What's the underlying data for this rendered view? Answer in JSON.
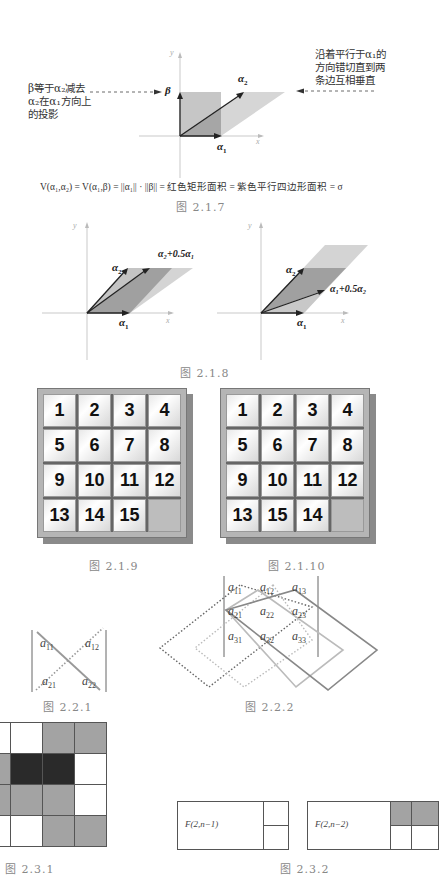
{
  "figure_2_1_7": {
    "caption": "图  2.1.7",
    "left_note": "β等于α₂减去\nα₂在α₁方向上\n的投影",
    "right_note": "沿着平行于α₁的\n方向错切直到两\n条边互相垂直",
    "labels": {
      "beta": "β",
      "alpha1": "α",
      "alpha1_sub": "1",
      "alpha2": "α",
      "alpha2_sub": "2",
      "x_axis": "x",
      "y_axis": "y"
    },
    "formula": "V(α₁,α₂) = V(α₁,β) = ||α₁|| · ||β|| = 红色矩形面积 = 紫色平行四边形面积  = σ",
    "colors": {
      "rectangle": "#c8c8c8",
      "parallelogram": "#d6d6d6",
      "overlap": "#a6a6a6"
    }
  },
  "figure_2_1_8": {
    "caption": "图  2.1.8",
    "left": {
      "alpha1": "α",
      "alpha1_sub": "1",
      "alpha2": "α",
      "alpha2_sub": "2",
      "sum_label": "α₂+0.5α₁",
      "x_axis": "x",
      "y_axis": "y"
    },
    "right": {
      "alpha1": "α",
      "alpha1_sub": "1",
      "alpha2": "α",
      "alpha2_sub": "2",
      "sum_label": "α₁+0.5α₂",
      "x_axis": "x",
      "y_axis": "y"
    }
  },
  "figure_2_1_9": {
    "caption": "图  2.1.9",
    "tiles": [
      "1",
      "2",
      "3",
      "4",
      "5",
      "6",
      "7",
      "8",
      "9",
      "10",
      "11",
      "12",
      "13",
      "14",
      "15",
      ""
    ]
  },
  "figure_2_1_10": {
    "caption": "图  2.1.10",
    "tiles": [
      "1",
      "2",
      "3",
      "4",
      "5",
      "6",
      "7",
      "8",
      "9",
      "10",
      "11",
      "12",
      "13",
      "15",
      "14",
      ""
    ]
  },
  "figure_2_2_1": {
    "caption": "图  2.2.1",
    "entries": [
      {
        "base": "a",
        "sub": "11"
      },
      {
        "base": "a",
        "sub": "12"
      },
      {
        "base": "a",
        "sub": "21"
      },
      {
        "base": "a",
        "sub": "22"
      }
    ]
  },
  "figure_2_2_2": {
    "caption": "图  2.2.2",
    "entries": [
      {
        "base": "a",
        "sub": "11"
      },
      {
        "base": "a",
        "sub": "12"
      },
      {
        "base": "a",
        "sub": "13"
      },
      {
        "base": "a",
        "sub": "21"
      },
      {
        "base": "a",
        "sub": "22"
      },
      {
        "base": "a",
        "sub": "23"
      },
      {
        "base": "a",
        "sub": "31"
      },
      {
        "base": "a",
        "sub": "32"
      },
      {
        "base": "a",
        "sub": "33"
      }
    ]
  },
  "figure_2_3_1": {
    "caption": "图  2.3.1",
    "grid": [
      [
        "white",
        "white",
        "gray",
        "gray"
      ],
      [
        "gray",
        "black",
        "black",
        "white"
      ],
      [
        "gray",
        "gray",
        "gray",
        "white"
      ],
      [
        "white",
        "white",
        "gray",
        "gray"
      ]
    ],
    "colors": {
      "white": "#ffffff",
      "gray": "#a3a3a3",
      "black": "#2a2a2a"
    }
  },
  "figure_2_3_2": {
    "caption": "图  2.3.2",
    "left_label": "F(2,n−1)",
    "right_label": "F(2,n−2)"
  }
}
